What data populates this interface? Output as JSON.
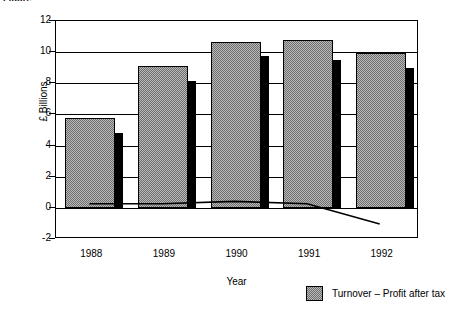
{
  "caption_fragment": "Figure",
  "chart_data": {
    "type": "bar",
    "title": "",
    "xlabel": "Year",
    "ylabel": "£ Billions",
    "categories": [
      "1988",
      "1989",
      "1990",
      "1991",
      "1992"
    ],
    "ylim": [
      -2,
      12
    ],
    "yticks": [
      -2,
      0,
      2,
      4,
      6,
      8,
      10,
      12
    ],
    "ytick_labels": [
      "-2",
      "0",
      "2",
      "4",
      "6",
      "8",
      "10",
      "12"
    ],
    "grid": true,
    "legend_position": "bottom-right",
    "series": [
      {
        "name": "Turnover",
        "kind": "bar",
        "style": "grey-dotted-fill",
        "color": "#b9b9b9",
        "values": [
          5.8,
          9.1,
          10.65,
          10.8,
          9.95
        ]
      },
      {
        "name": "Turnover – Profit after tax",
        "kind": "bar",
        "style": "solid-black",
        "color": "#000000",
        "values": [
          4.8,
          8.15,
          9.75,
          9.5,
          9.0
        ]
      },
      {
        "name": "Profit after tax",
        "kind": "line",
        "style": "thin-black-line",
        "color": "#000000",
        "values": [
          0.2,
          0.2,
          0.35,
          0.2,
          -1.1
        ]
      }
    ],
    "legend": [
      {
        "label": "Turnover – Profit after tax",
        "swatch": "grey-dotted-fill"
      }
    ]
  }
}
